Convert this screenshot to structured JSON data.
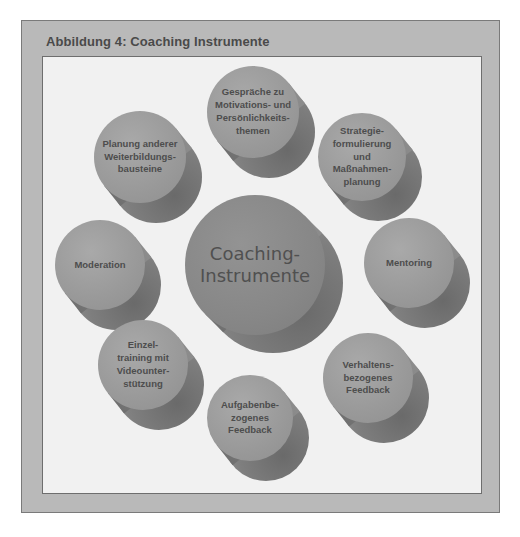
{
  "figure": {
    "title": "Abbildung 4: Coaching Instrumente"
  },
  "diagram": {
    "center": {
      "label": "Coaching-\nInstrumente",
      "cx": 255,
      "cy": 265,
      "r": 70,
      "dx": 18,
      "dy": 18
    },
    "nodes": [
      {
        "id": "gespraeche",
        "label": "Gespräche zu\nMotivations- und\nPersönlichkeits-\nthemen",
        "cx": 253,
        "cy": 112,
        "r": 46,
        "dx": 16,
        "dy": 20
      },
      {
        "id": "planung",
        "label": "Planung anderer\nWeiterbildungs-\nbausteine",
        "cx": 140,
        "cy": 157,
        "r": 46,
        "dx": 16,
        "dy": 20
      },
      {
        "id": "strategie",
        "label": "Strategie-\nformulierung\nund\nMaßnahmen-\nplanung",
        "cx": 362,
        "cy": 157,
        "r": 44,
        "dx": 16,
        "dy": 20
      },
      {
        "id": "moderation",
        "label": "Moderation",
        "cx": 100,
        "cy": 265,
        "r": 45,
        "dx": 16,
        "dy": 20
      },
      {
        "id": "mentoring",
        "label": "Mentoring",
        "cx": 409,
        "cy": 263,
        "r": 45,
        "dx": 16,
        "dy": 20
      },
      {
        "id": "einzeltraining",
        "label": "Einzel-\ntraining mit\nVideounter-\nstützung",
        "cx": 143,
        "cy": 365,
        "r": 45,
        "dx": 16,
        "dy": 20
      },
      {
        "id": "verhaltens",
        "label": "Verhaltens-\nbezogenes\nFeedback",
        "cx": 368,
        "cy": 378,
        "r": 45,
        "dx": 16,
        "dy": 20
      },
      {
        "id": "aufgaben",
        "label": "Aufgabenbe-\nzogenes\nFeedback",
        "cx": 250,
        "cy": 418,
        "r": 43,
        "dx": 16,
        "dy": 20
      }
    ]
  },
  "colors": {
    "frame": "#b9b9b9",
    "panel": "#f1f1f1",
    "face": "#999999",
    "body": "#757575",
    "text": "#4d4d4d"
  }
}
